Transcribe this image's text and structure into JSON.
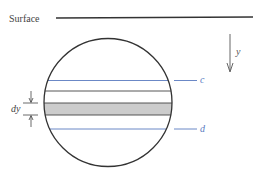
{
  "diagram": {
    "surface_label": "Surface",
    "depth_label": "y",
    "upper_line_label": "c",
    "lower_line_label": "d",
    "strip_label": "dy",
    "colors": {
      "stroke": "#333333",
      "blue_line": "#5a7bbf",
      "strip_fill": "#cccccc",
      "text": "#444444"
    }
  }
}
